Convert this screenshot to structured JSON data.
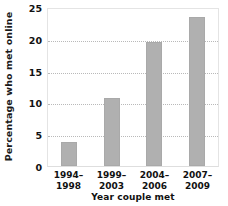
{
  "chart_data": {
    "type": "bar",
    "title": "",
    "subtitle": "",
    "xlabel": "Year couple met",
    "ylabel": "Percentage who met online",
    "categories": [
      "1994-1998",
      "1999-2003",
      "2004-2006",
      "2007-2009"
    ],
    "category_lines": [
      {
        "line1": "1994–",
        "line2": "1998"
      },
      {
        "line1": "1999–",
        "line2": "2003"
      },
      {
        "line1": "2004–",
        "line2": "2006"
      },
      {
        "line1": "2007–",
        "line2": "2009"
      }
    ],
    "values": [
      3.8,
      10.7,
      19.5,
      23.4
    ],
    "ylim": [
      0,
      25
    ],
    "yticks": [
      0,
      5,
      10,
      15,
      20,
      25
    ],
    "ytick_labels": [
      "0",
      "5",
      "10",
      "15",
      "20",
      "25"
    ],
    "grid": true,
    "grid_axis": "y",
    "grid_style": "dotted",
    "legend": false,
    "legend_position": "none",
    "bar_color": "#b0b0b0",
    "background_color": "#ffffff",
    "axis_color": "#e4e4e4",
    "text_color": "#111111"
  }
}
